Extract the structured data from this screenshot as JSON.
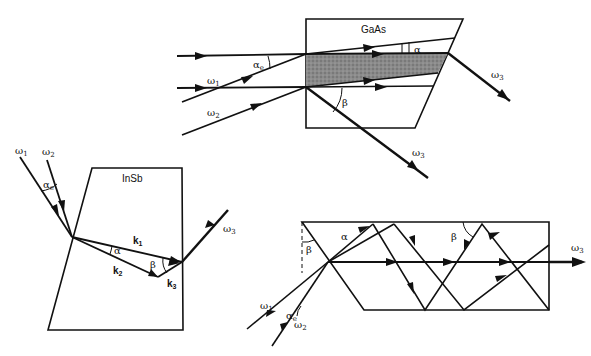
{
  "figure": {
    "panels": [
      {
        "id": "gaas",
        "material": "GaAs",
        "labels": {
          "material": "GaAs",
          "input_beam_1": "ω",
          "input_beam_1_sub": "1",
          "input_beam_2": "ω",
          "input_beam_2_sub": "2",
          "external_angle": "α",
          "external_angle_sub": "e",
          "internal_angle": "α",
          "output_angle": "β",
          "output_beam_top": "ω",
          "output_beam_top_sub": "3",
          "output_beam_bottom": "ω",
          "output_beam_bottom_sub": "3"
        }
      },
      {
        "id": "insb",
        "material": "InSb",
        "labels": {
          "material": "InSb",
          "input_beam_1": "ω",
          "input_beam_1_sub": "1",
          "input_beam_2": "ω",
          "input_beam_2_sub": "2",
          "external_angle": "α",
          "external_angle_sub": "e",
          "internal_angle": "α",
          "output_angle": "β",
          "k1": "k",
          "k1_sub": "1",
          "k2": "k",
          "k2_sub": "2",
          "k3": "k",
          "k3_sub": "3",
          "output_beam": "ω",
          "output_beam_sub": "3"
        }
      },
      {
        "id": "waveguide",
        "labels": {
          "input_beam_1": "ω",
          "input_beam_1_sub": "1",
          "input_beam_2": "ω",
          "input_beam_2_sub": "2",
          "external_angle": "α",
          "external_angle_sub": "e",
          "internal_angle": "α",
          "facet_angle": "β",
          "reflection_angle": "β",
          "output_beam": "ω",
          "output_beam_sub": "3"
        }
      }
    ]
  }
}
